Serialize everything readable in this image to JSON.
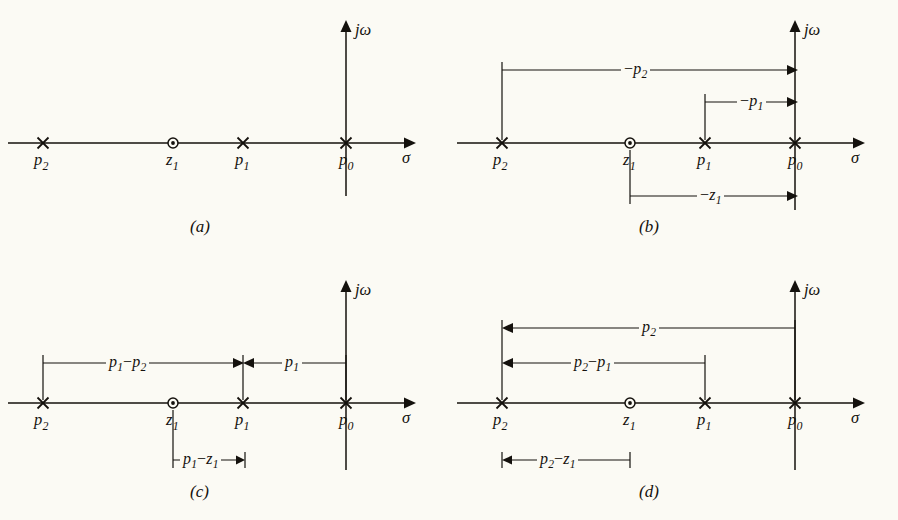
{
  "figure": {
    "background": "#fbfaf4",
    "ink": "#14110d",
    "axis_labels": {
      "imaginary": "jω",
      "real": "σ"
    },
    "markers": {
      "pole_symbol": "×",
      "zero_symbol": "⊙"
    },
    "pole_labels": {
      "p0": "p",
      "p0_sub": "0",
      "p1": "p",
      "p1_sub": "1",
      "p2": "p",
      "p2_sub": "2",
      "z1": "z",
      "z1_sub": "1"
    }
  },
  "panels": [
    {
      "id": "a",
      "caption": "(a)",
      "points": [
        {
          "name": "p2",
          "type": "pole",
          "x": 43,
          "label": "p",
          "sub": "2"
        },
        {
          "name": "z1",
          "type": "zero",
          "x": 173,
          "label": "z",
          "sub": "1"
        },
        {
          "name": "p1",
          "type": "pole",
          "x": 243,
          "label": "p",
          "sub": "1"
        },
        {
          "name": "p0",
          "type": "pole",
          "x": 346,
          "label": "p",
          "sub": "0"
        }
      ],
      "dimensions": []
    },
    {
      "id": "b",
      "caption": "(b)",
      "points": [
        {
          "name": "p2",
          "type": "pole",
          "x": 53,
          "label": "p",
          "sub": "2"
        },
        {
          "name": "z1",
          "type": "zero",
          "x": 181,
          "label": "z",
          "sub": "1"
        },
        {
          "name": "p1",
          "type": "pole",
          "x": 256,
          "label": "p",
          "sub": "1"
        },
        {
          "name": "p0",
          "type": "pole",
          "x": 346,
          "label": "p",
          "sub": "0"
        }
      ],
      "dimensions": [
        {
          "name": "neg-p2",
          "minus": "−",
          "label": "p",
          "sub": "2",
          "from": 53,
          "to": 346,
          "y": 70,
          "direction": "right"
        },
        {
          "name": "neg-p1",
          "minus": "−",
          "label": "p",
          "sub": "1",
          "from": 256,
          "to": 346,
          "y": 102,
          "direction": "right"
        },
        {
          "name": "neg-z1",
          "minus": "−",
          "label": "z",
          "sub": "1",
          "from": 181,
          "to": 346,
          "y": 196,
          "direction": "right"
        }
      ]
    },
    {
      "id": "c",
      "caption": "(c)",
      "points": [
        {
          "name": "p2",
          "type": "pole",
          "x": 43,
          "label": "p",
          "sub": "2"
        },
        {
          "name": "z1",
          "type": "zero",
          "x": 173,
          "label": "z",
          "sub": "1"
        },
        {
          "name": "p1",
          "type": "pole",
          "x": 243,
          "label": "p",
          "sub": "1"
        },
        {
          "name": "p0",
          "type": "pole",
          "x": 346,
          "label": "p",
          "sub": "0"
        }
      ],
      "dimensions": [
        {
          "name": "p1-minus-p2",
          "label": "p",
          "sub": "1",
          "minus2": "−",
          "label2": "p",
          "sub2": "2",
          "from": 43,
          "to": 243,
          "y": 103,
          "direction": "right"
        },
        {
          "name": "p1-span",
          "label": "p",
          "sub": "1",
          "from": 346,
          "to": 243,
          "y": 103,
          "direction": "left"
        },
        {
          "name": "p1-minus-z1",
          "label": "p",
          "sub": "1",
          "minus2": "−",
          "label2": "z",
          "sub2": "1",
          "from": 173,
          "to": 243,
          "y": 200,
          "direction": "right"
        }
      ]
    },
    {
      "id": "d",
      "caption": "(d)",
      "points": [
        {
          "name": "p2",
          "type": "pole",
          "x": 53,
          "label": "p",
          "sub": "2"
        },
        {
          "name": "z1",
          "type": "zero",
          "x": 181,
          "label": "z",
          "sub": "1"
        },
        {
          "name": "p1",
          "type": "pole",
          "x": 256,
          "label": "p",
          "sub": "1"
        },
        {
          "name": "p0",
          "type": "pole",
          "x": 346,
          "label": "p",
          "sub": "0"
        }
      ],
      "dimensions": [
        {
          "name": "p2-span",
          "label": "p",
          "sub": "2",
          "from": 346,
          "to": 53,
          "y": 68,
          "direction": "left"
        },
        {
          "name": "p2-minus-p1",
          "label": "p",
          "sub": "2",
          "minus2": "−",
          "label2": "p",
          "sub2": "1",
          "from": 256,
          "to": 53,
          "y": 103,
          "direction": "left"
        },
        {
          "name": "p2-minus-z1",
          "label": "p",
          "sub": "2",
          "minus2": "−",
          "label2": "z",
          "sub2": "1",
          "from": 181,
          "to": 53,
          "y": 200,
          "direction": "left"
        }
      ]
    }
  ]
}
